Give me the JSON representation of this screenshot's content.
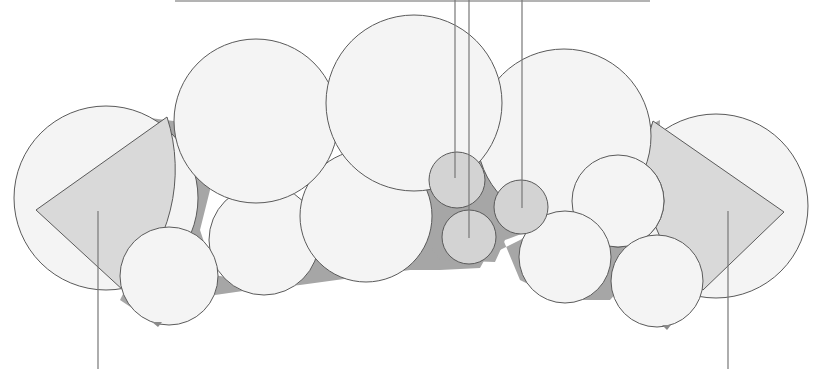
{
  "diagram": {
    "type": "circle-packing-illustration",
    "colors": {
      "background": "#ffffff",
      "circle_fill": "#f4f4f4",
      "small_circle_fill": "#d3d3d3",
      "gap_fill": "#a6a6a6",
      "sector_fill": "#d9d9d9",
      "stroke": "#5a5a5a",
      "leader_line": "#777777"
    },
    "top_rule": {
      "x1": 175,
      "x2": 650,
      "y": 1
    },
    "large_circles": [
      {
        "id": "left-outer",
        "cx": 106,
        "cy": 198,
        "r": 92
      },
      {
        "id": "top-left",
        "cx": 256,
        "cy": 121,
        "r": 82
      },
      {
        "id": "top-center",
        "cx": 414,
        "cy": 103,
        "r": 88
      },
      {
        "id": "top-right",
        "cx": 564,
        "cy": 136,
        "r": 87
      },
      {
        "id": "right-outer",
        "cx": 716,
        "cy": 206,
        "r": 92
      }
    ],
    "medium_circles": [
      {
        "id": "mid-left-a",
        "cx": 264,
        "cy": 240,
        "r": 55
      },
      {
        "id": "mid-left-b",
        "cx": 366,
        "cy": 216,
        "r": 66
      },
      {
        "id": "bottom-left",
        "cx": 169,
        "cy": 276,
        "r": 49
      },
      {
        "id": "mid-right-a",
        "cx": 618,
        "cy": 201,
        "r": 46
      },
      {
        "id": "mid-right-b",
        "cx": 565,
        "cy": 257,
        "r": 46
      },
      {
        "id": "bottom-right",
        "cx": 657,
        "cy": 281,
        "r": 46
      }
    ],
    "small_circles": [
      {
        "id": "small-top",
        "cx": 457,
        "cy": 180,
        "r": 28
      },
      {
        "id": "small-bottom",
        "cx": 469,
        "cy": 237,
        "r": 27
      },
      {
        "id": "small-right",
        "cx": 521,
        "cy": 207,
        "r": 27
      }
    ],
    "sectors": [
      {
        "id": "left-sector",
        "tip": [
          36,
          210
        ],
        "start": [
          167,
          117
        ],
        "end": [
          124,
          291
        ],
        "r": 170
      },
      {
        "id": "right-sector",
        "tip": [
          784,
          212
        ],
        "start": [
          653,
          121
        ],
        "end": [
          703,
          290
        ],
        "r": 152
      }
    ],
    "leader_lines": [
      {
        "id": "leader-small-top",
        "x": 455,
        "y1": 0,
        "y2": 178
      },
      {
        "id": "leader-small-bottom",
        "x": 469,
        "y1": 0,
        "y2": 238
      },
      {
        "id": "leader-small-right",
        "x": 522,
        "y1": 0,
        "y2": 208
      },
      {
        "id": "leader-left-sector",
        "x": 98,
        "y1": 211,
        "y2": 369
      },
      {
        "id": "leader-right-sector",
        "x": 728,
        "y1": 211,
        "y2": 369
      }
    ]
  }
}
